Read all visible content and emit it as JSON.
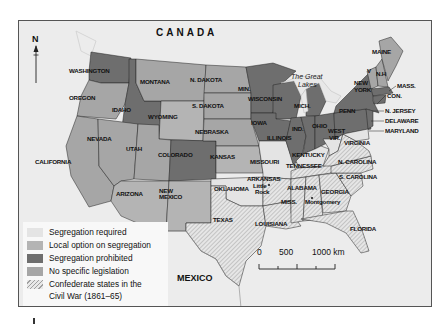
{
  "map": {
    "title_labels": {
      "canada": "CANADA",
      "mexico": "MEXICO",
      "lakes_line1": "The Great",
      "lakes_line2": "Lakes",
      "north": "N"
    },
    "colors": {
      "segregation_required": "#e4e4e4",
      "local_option": "#b4b4b4",
      "segregation_prohibited": "#6e6e6e",
      "no_specific_legislation": "#a6a6a6",
      "background": "#ececec",
      "frame": "#555555"
    },
    "states": [
      {
        "name": "WASHINGTON",
        "category": "segregation_prohibited"
      },
      {
        "name": "OREGON",
        "category": "no_specific_legislation"
      },
      {
        "name": "CALIFORNIA",
        "category": "no_specific_legislation"
      },
      {
        "name": "IDAHO",
        "category": "segregation_prohibited"
      },
      {
        "name": "NEVADA",
        "category": "no_specific_legislation"
      },
      {
        "name": "MONTANA",
        "category": "no_specific_legislation"
      },
      {
        "name": "WYOMING",
        "category": "local_option"
      },
      {
        "name": "UTAH",
        "category": "no_specific_legislation"
      },
      {
        "name": "COLORADO",
        "category": "segregation_prohibited"
      },
      {
        "name": "ARIZONA",
        "category": "local_option"
      },
      {
        "name": "NEW MEXICO",
        "category": "local_option"
      },
      {
        "name": "N. DAKOTA",
        "category": "no_specific_legislation"
      },
      {
        "name": "S. DAKOTA",
        "category": "no_specific_legislation"
      },
      {
        "name": "NEBRASKA",
        "category": "no_specific_legislation"
      },
      {
        "name": "KANSAS",
        "category": "local_option"
      },
      {
        "name": "OKLAHOMA",
        "category": "segregation_required"
      },
      {
        "name": "TEXAS",
        "category": "segregation_required",
        "confederate": true
      },
      {
        "name": "MIN.",
        "category": "segregation_prohibited"
      },
      {
        "name": "IOWA",
        "category": "segregation_prohibited"
      },
      {
        "name": "MISSOURI",
        "category": "segregation_required"
      },
      {
        "name": "ARKANSAS",
        "category": "segregation_required",
        "confederate": true
      },
      {
        "name": "LOUISIANA",
        "category": "segregation_required",
        "confederate": true
      },
      {
        "name": "WISCONSIN",
        "category": "segregation_prohibited"
      },
      {
        "name": "ILLINOIS",
        "category": "segregation_prohibited"
      },
      {
        "name": "MICH.",
        "category": "segregation_prohibited"
      },
      {
        "name": "IND.",
        "category": "segregation_prohibited"
      },
      {
        "name": "OHIO",
        "category": "segregation_prohibited"
      },
      {
        "name": "KENTUCKY",
        "category": "segregation_required"
      },
      {
        "name": "TENNESSEE",
        "category": "segregation_required",
        "confederate": true
      },
      {
        "name": "MISS.",
        "category": "segregation_required",
        "confederate": true
      },
      {
        "name": "ALABAMA",
        "category": "segregation_required",
        "confederate": true
      },
      {
        "name": "GEORGIA",
        "category": "segregation_required",
        "confederate": true
      },
      {
        "name": "FLORIDA",
        "category": "segregation_required",
        "confederate": true
      },
      {
        "name": "S. CAROLINA",
        "category": "segregation_required",
        "confederate": true
      },
      {
        "name": "N. CAROLINA",
        "category": "segregation_required",
        "confederate": true
      },
      {
        "name": "VIRGINIA",
        "category": "segregation_required",
        "confederate": true
      },
      {
        "name": "WEST VIR.",
        "category": "segregation_required"
      },
      {
        "name": "PENN",
        "category": "segregation_prohibited"
      },
      {
        "name": "NEW YORK",
        "category": "segregation_prohibited"
      },
      {
        "name": "V",
        "category": "no_specific_legislation"
      },
      {
        "name": "N.H",
        "category": "no_specific_legislation"
      },
      {
        "name": "MAINE",
        "category": "no_specific_legislation"
      },
      {
        "name": "MASS.",
        "category": "segregation_prohibited"
      },
      {
        "name": "CON.",
        "category": "segregation_prohibited"
      },
      {
        "name": "N. JERSEY",
        "category": "segregation_prohibited"
      },
      {
        "name": "DELAWARE",
        "category": "segregation_required"
      },
      {
        "name": "MARYLAND",
        "category": "segregation_required"
      }
    ],
    "cities": [
      {
        "name_line1": "Little",
        "name_line2": "Rock"
      },
      {
        "name_line1": "Montgomery",
        "name_line2": ""
      }
    ]
  },
  "legend": {
    "items": [
      {
        "label": "Segregation required",
        "color": "#e4e4e4"
      },
      {
        "label": "Local option on segregation",
        "color": "#b4b4b4"
      },
      {
        "label": "Segregation prohibited",
        "color": "#6e6e6e"
      },
      {
        "label": "No specific legislation",
        "color": "#a6a6a6"
      },
      {
        "label": "Confederate states in the",
        "label_line2": "Civil War (1861–65)",
        "pattern": "hatched"
      }
    ]
  },
  "scale_bar": {
    "ticks": [
      "0",
      "500",
      "1000 km"
    ]
  }
}
